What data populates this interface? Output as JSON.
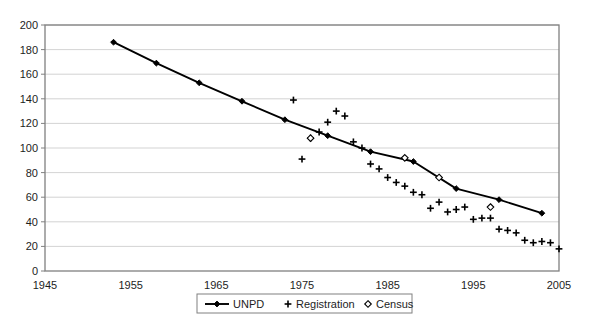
{
  "chart_data": {
    "type": "line",
    "title": "",
    "subtitle": "",
    "xlabel": "",
    "ylabel": "",
    "xlim": [
      1945,
      2005
    ],
    "ylim": [
      0,
      200
    ],
    "xticks": [
      1945,
      1955,
      1965,
      1975,
      1985,
      1995,
      2005
    ],
    "yticks": [
      0,
      20,
      40,
      60,
      80,
      100,
      120,
      140,
      160,
      180,
      200
    ],
    "grid": "horizontal",
    "legend_position": "bottom-center",
    "plot_border": true,
    "series": [
      {
        "name": "UNPD",
        "marker": "filled-diamond",
        "line": true,
        "color": "#000000",
        "points": [
          [
            1953,
            186
          ],
          [
            1958,
            169
          ],
          [
            1963,
            153
          ],
          [
            1968,
            138
          ],
          [
            1973,
            123
          ],
          [
            1978,
            110
          ],
          [
            1983,
            97
          ],
          [
            1988,
            89
          ],
          [
            1993,
            67
          ],
          [
            1998,
            58
          ],
          [
            2003,
            47
          ]
        ]
      },
      {
        "name": "Registration",
        "marker": "plus",
        "line": false,
        "color": "#000000",
        "points": [
          [
            1974,
            139
          ],
          [
            1975,
            91
          ],
          [
            1976,
            108
          ],
          [
            1977,
            113
          ],
          [
            1978,
            121
          ],
          [
            1979,
            130
          ],
          [
            1980,
            126
          ],
          [
            1981,
            105
          ],
          [
            1982,
            100
          ],
          [
            1983,
            87
          ],
          [
            1984,
            83
          ],
          [
            1985,
            76
          ],
          [
            1986,
            72
          ],
          [
            1987,
            69
          ],
          [
            1988,
            64
          ],
          [
            1989,
            62
          ],
          [
            1990,
            51
          ],
          [
            1991,
            56
          ],
          [
            1992,
            48
          ],
          [
            1993,
            50
          ],
          [
            1994,
            52
          ],
          [
            1995,
            42
          ],
          [
            1996,
            43
          ],
          [
            1997,
            43
          ],
          [
            1998,
            34
          ],
          [
            1999,
            33
          ],
          [
            2000,
            31
          ],
          [
            2001,
            25
          ],
          [
            2002,
            23
          ],
          [
            2003,
            24
          ],
          [
            2004,
            23
          ],
          [
            2005,
            18
          ]
        ]
      },
      {
        "name": "Census",
        "marker": "open-diamond",
        "line": false,
        "color": "#000000",
        "points": [
          [
            1976,
            108
          ],
          [
            1987,
            92
          ],
          [
            1991,
            76
          ],
          [
            1997,
            52
          ]
        ]
      }
    ]
  },
  "legend": {
    "items": [
      {
        "label": "UNPD",
        "marker": "line-filled-diamond"
      },
      {
        "label": "Registration",
        "marker": "plus"
      },
      {
        "label": "Census",
        "marker": "open-diamond"
      }
    ]
  },
  "axes": {
    "x_tick_labels": [
      "1945",
      "1955",
      "1965",
      "1975",
      "1985",
      "1995",
      "2005"
    ],
    "y_tick_labels": [
      "0",
      "20",
      "40",
      "60",
      "80",
      "100",
      "120",
      "140",
      "160",
      "180",
      "200"
    ]
  },
  "style": {
    "background": "#ffffff",
    "plot_background": "#ffffff",
    "border_color": "#808080",
    "grid_color": "#c8c8c8",
    "series_color": "#000000"
  }
}
